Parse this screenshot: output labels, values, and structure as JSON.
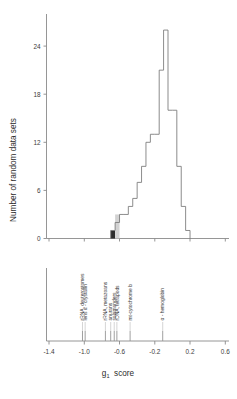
{
  "figure": {
    "type": "histogram-with-rug",
    "background": "#ffffff",
    "outline_color": "#777777",
    "axis_color": "#8a8a8a"
  },
  "axes": {
    "y_label": "Number of random data sets",
    "y_ticks": [
      "0",
      "6",
      "12",
      "18",
      "24"
    ],
    "y_tick_values": [
      0,
      6,
      12,
      18,
      24
    ],
    "y_min": 0,
    "y_max": 28,
    "x_ticks": [
      "-1.4",
      "-1.0",
      "-0.6",
      "-0.2",
      "0.2",
      "0.6"
    ],
    "x_tick_values": [
      -1.4,
      -1.0,
      -0.6,
      -0.2,
      0.2,
      0.6
    ],
    "x_min": -1.45,
    "x_max": 0.62,
    "x_title_main": "g",
    "x_title_sub": "1",
    "x_title_rest": "score"
  },
  "chart_data": {
    "type": "bar",
    "title": "",
    "xlabel": "g1 score",
    "ylabel": "Number of random data sets",
    "xlim": [
      -1.45,
      0.62
    ],
    "ylim": [
      0,
      28
    ],
    "grid": false,
    "legend": "none",
    "bin_width": 0.05,
    "bin_left_edges": [
      -0.7,
      -0.65,
      -0.6,
      -0.55,
      -0.5,
      -0.45,
      -0.4,
      -0.35,
      -0.3,
      -0.25,
      -0.2,
      -0.15,
      -0.1,
      -0.05,
      0.0,
      0.05,
      0.1,
      0.15
    ],
    "categories": [
      "-0.70",
      "-0.65",
      "-0.60",
      "-0.55",
      "-0.50",
      "-0.45",
      "-0.40",
      "-0.35",
      "-0.30",
      "-0.25",
      "-0.20",
      "-0.15",
      "-0.10",
      "-0.05",
      "0.00",
      "0.05",
      "0.10",
      "0.15"
    ],
    "values": [
      1,
      2,
      3,
      3,
      4,
      5,
      7,
      9,
      12,
      13,
      13,
      21,
      26,
      16,
      16,
      9,
      4,
      1
    ],
    "shaded_bins": [
      {
        "left": -0.7,
        "right": -0.65,
        "height": 1,
        "fill": "#2d2d2d",
        "name": "dark-shaded-bin"
      },
      {
        "left": -0.65,
        "right": -0.6,
        "height": 3,
        "fill": "#d2d2d2",
        "name": "grey-shaded-bin"
      }
    ]
  },
  "datasets_panel": {
    "name": "observed-dataset-rug",
    "items": [
      {
        "label": "rRNA, deuterostomes",
        "g1": -1.02
      },
      {
        "label": "lens α - crystallin",
        "g1": -0.99
      },
      {
        "label": "rRNA, metazoans",
        "g1": -0.76
      },
      {
        "label": "anurans",
        "g1": -0.7
      },
      {
        "label": "salamanders",
        "g1": -0.66
      },
      {
        "label": "rDNA, tetrapods",
        "g1": -0.63
      },
      {
        "label": "mt-cytochrome  b",
        "g1": -0.48
      },
      {
        "label": "α - hemoglobin",
        "g1": -0.11
      }
    ]
  }
}
